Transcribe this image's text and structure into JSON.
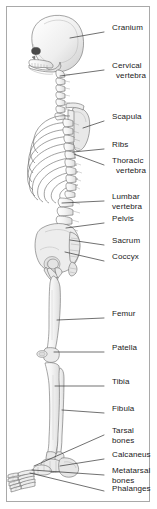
{
  "figure": {
    "background_color": "#ffffff",
    "border_color": "#a9a9a9",
    "bone_fill": "#f2f2f2",
    "bone_outline": "#666666",
    "leader_line_color": "#333333",
    "label_text_color": "#1a1a1a"
  },
  "labels": [
    {
      "id": "cranium",
      "text": "Cranium",
      "line2": "",
      "x": 112,
      "y": 28,
      "leader_from_x": 104,
      "leader_from_y": 32,
      "leader_to_x": 70,
      "leader_to_y": 38
    },
    {
      "id": "cervical-vertebra",
      "text": "Cervical",
      "line2": "vertebra",
      "x": 112,
      "y": 66,
      "leader_from_x": 104,
      "leader_from_y": 70,
      "leader_to_x": 60,
      "leader_to_y": 76
    },
    {
      "id": "scapula",
      "text": "Scapula",
      "line2": "",
      "x": 112,
      "y": 117,
      "leader_from_x": 104,
      "leader_from_y": 121,
      "leader_to_x": 83,
      "leader_to_y": 128
    },
    {
      "id": "ribs",
      "text": "Ribs",
      "line2": "",
      "x": 112,
      "y": 145,
      "leader_from_x": 104,
      "leader_from_y": 149,
      "leader_to_x": 73,
      "leader_to_y": 152
    },
    {
      "id": "thoracic-vertebra",
      "text": "Thoracic",
      "line2": "vertebra",
      "x": 112,
      "y": 161,
      "leader_from_x": 104,
      "leader_from_y": 165,
      "leader_to_x": 74,
      "leader_to_y": 154
    },
    {
      "id": "lumbar-vertebra",
      "text": "Lumbar",
      "line2": "vertebra",
      "x": 112,
      "y": 197,
      "leader_from_x": 104,
      "leader_from_y": 201,
      "leader_to_x": 62,
      "leader_to_y": 203
    },
    {
      "id": "pelvis",
      "text": "Pelvis",
      "line2": "",
      "x": 112,
      "y": 219,
      "leader_from_x": 104,
      "leader_from_y": 223,
      "leader_to_x": 66,
      "leader_to_y": 228
    },
    {
      "id": "sacrum",
      "text": "Sacrum",
      "line2": "",
      "x": 112,
      "y": 241,
      "leader_from_x": 104,
      "leader_from_y": 245,
      "leader_to_x": 70,
      "leader_to_y": 240
    },
    {
      "id": "coccyx",
      "text": "Coccyx",
      "line2": "",
      "x": 112,
      "y": 257,
      "leader_from_x": 104,
      "leader_from_y": 261,
      "leader_to_x": 65,
      "leader_to_y": 252
    },
    {
      "id": "femur",
      "text": "Femur",
      "line2": "",
      "x": 112,
      "y": 314,
      "leader_from_x": 104,
      "leader_from_y": 318,
      "leader_to_x": 57,
      "leader_to_y": 320
    },
    {
      "id": "patella",
      "text": "Patella",
      "line2": "",
      "x": 112,
      "y": 348,
      "leader_from_x": 104,
      "leader_from_y": 352,
      "leader_to_x": 54,
      "leader_to_y": 352
    },
    {
      "id": "tibia",
      "text": "Tibia",
      "line2": "",
      "x": 112,
      "y": 382,
      "leader_from_x": 104,
      "leader_from_y": 386,
      "leader_to_x": 55,
      "leader_to_y": 386
    },
    {
      "id": "fibula",
      "text": "Fibula",
      "line2": "",
      "x": 112,
      "y": 409,
      "leader_from_x": 104,
      "leader_from_y": 413,
      "leader_to_x": 62,
      "leader_to_y": 410
    },
    {
      "id": "tarsal-bones",
      "text": "Tarsal",
      "line2": "bones",
      "x": 112,
      "y": 431,
      "leader_from_x": 104,
      "leader_from_y": 435,
      "leader_to_x": 34,
      "leader_to_y": 466
    },
    {
      "id": "calcaneus",
      "text": "Calcaneus",
      "line2": "",
      "x": 112,
      "y": 455,
      "leader_from_x": 104,
      "leader_from_y": 459,
      "leader_to_x": 60,
      "leader_to_y": 466
    },
    {
      "id": "metatarsal-bones",
      "text": "Metatarsal",
      "line2": "bones",
      "x": 112,
      "y": 471,
      "leader_from_x": 104,
      "leader_from_y": 475,
      "leader_to_x": 32,
      "leader_to_y": 470
    },
    {
      "id": "phalanges",
      "text": "Phalanges",
      "line2": "",
      "x": 112,
      "y": 489,
      "leader_from_x": 104,
      "leader_from_y": 491,
      "leader_to_x": 30,
      "leader_to_y": 473
    }
  ],
  "anatomy_parts": [
    {
      "id": "cranium",
      "name": "Cranium"
    },
    {
      "id": "mandible",
      "name": "Mandible"
    },
    {
      "id": "cervical-vertebra",
      "name": "Cervical vertebra"
    },
    {
      "id": "scapula",
      "name": "Scapula"
    },
    {
      "id": "ribs",
      "name": "Ribs"
    },
    {
      "id": "thoracic-vertebra",
      "name": "Thoracic vertebra"
    },
    {
      "id": "lumbar-vertebra",
      "name": "Lumbar vertebra"
    },
    {
      "id": "pelvis",
      "name": "Pelvis"
    },
    {
      "id": "sacrum",
      "name": "Sacrum"
    },
    {
      "id": "coccyx",
      "name": "Coccyx"
    },
    {
      "id": "femur",
      "name": "Femur"
    },
    {
      "id": "patella",
      "name": "Patella"
    },
    {
      "id": "tibia",
      "name": "Tibia"
    },
    {
      "id": "fibula",
      "name": "Fibula"
    },
    {
      "id": "tarsal-bones",
      "name": "Tarsal bones"
    },
    {
      "id": "calcaneus",
      "name": "Calcaneus"
    },
    {
      "id": "metatarsal-bones",
      "name": "Metatarsal bones"
    },
    {
      "id": "phalanges",
      "name": "Phalanges"
    }
  ]
}
